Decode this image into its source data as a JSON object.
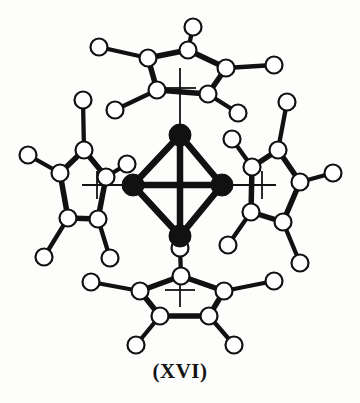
{
  "figure": {
    "label": "(XVI)",
    "diagram_type": "molecular-structure",
    "colors": {
      "background": "#fdfdfc",
      "bond_stroke": "#111111",
      "metal_fill": "#111111",
      "atom_fill": "#ffffff",
      "atom_stroke": "#111111",
      "axis_stroke": "#141414",
      "label_color": "#141414"
    },
    "geometry": {
      "metal_radius": 11,
      "carbon_radius": 8.5,
      "hydrogen_radius": 8.5,
      "bond_width": 5.5,
      "cluster_bond_width": 6.5,
      "axis_width": 1.8,
      "atom_stroke_width": 2.2
    },
    "metal_core": {
      "shape": "tetrahedron",
      "atoms": [
        {
          "id": "M1",
          "position": "top",
          "x": 180,
          "y": 135
        },
        {
          "id": "M2",
          "position": "left",
          "x": 133,
          "y": 185
        },
        {
          "id": "M3",
          "position": "right",
          "x": 222,
          "y": 185
        },
        {
          "id": "M4",
          "position": "bottom",
          "x": 180,
          "y": 236
        }
      ],
      "bonds": [
        {
          "from": "M1",
          "to": "M2"
        },
        {
          "from": "M1",
          "to": "M3"
        },
        {
          "from": "M2",
          "to": "M4"
        },
        {
          "from": "M3",
          "to": "M4"
        },
        {
          "from": "M2",
          "to": "M3"
        },
        {
          "from": "M1",
          "to": "M4"
        }
      ]
    },
    "axes": [
      {
        "id": "vertical-axis",
        "x1": 180,
        "y1": 68,
        "x2": 180,
        "y2": 307
      },
      {
        "id": "horizontal-axis",
        "x1": 82,
        "y1": 185,
        "x2": 276,
        "y2": 185
      },
      {
        "id": "tick-top-upper",
        "x1": 164,
        "y1": 88,
        "x2": 196,
        "y2": 88
      },
      {
        "id": "tick-bottom-lower",
        "x1": 165,
        "y1": 290,
        "x2": 195,
        "y2": 290
      },
      {
        "id": "tick-left-outer",
        "x1": 97,
        "y1": 171,
        "x2": 97,
        "y2": 199
      },
      {
        "id": "tick-right-outer",
        "x1": 262,
        "y1": 171,
        "x2": 262,
        "y2": 199
      }
    ],
    "ligands": [
      {
        "id": "cp-top",
        "name": "cyclopentadienyl-top",
        "formula": "C5H5",
        "bonded_metal": "M1",
        "carbons": [
          {
            "id": "C1",
            "x": 188,
            "y": 50
          },
          {
            "id": "C2",
            "x": 148,
            "y": 58
          },
          {
            "id": "C3",
            "x": 157,
            "y": 90
          },
          {
            "id": "C4",
            "x": 208,
            "y": 94
          },
          {
            "id": "C5",
            "x": 226,
            "y": 68
          }
        ],
        "hydrogens": [
          {
            "id": "H1",
            "x": 193,
            "y": 27,
            "carbon": "C1"
          },
          {
            "id": "H2",
            "x": 99,
            "y": 47,
            "carbon": "C2"
          },
          {
            "id": "H3",
            "x": 115,
            "y": 110,
            "carbon": "C3"
          },
          {
            "id": "H4",
            "x": 238,
            "y": 113,
            "carbon": "C4"
          },
          {
            "id": "H5",
            "x": 274,
            "y": 65,
            "carbon": "C5"
          }
        ]
      },
      {
        "id": "cp-left",
        "name": "cyclopentadienyl-left",
        "formula": "C5H5",
        "bonded_metal": "M2",
        "carbons": [
          {
            "id": "C1",
            "x": 84,
            "y": 150
          },
          {
            "id": "C2",
            "x": 60,
            "y": 173
          },
          {
            "id": "C3",
            "x": 68,
            "y": 218
          },
          {
            "id": "C4",
            "x": 98,
            "y": 219
          },
          {
            "id": "C5",
            "x": 106,
            "y": 177
          }
        ],
        "hydrogens": [
          {
            "id": "H1",
            "x": 83,
            "y": 100,
            "carbon": "C1"
          },
          {
            "id": "H2",
            "x": 28,
            "y": 155,
            "carbon": "C2"
          },
          {
            "id": "H3",
            "x": 44,
            "y": 257,
            "carbon": "C3"
          },
          {
            "id": "H4",
            "x": 110,
            "y": 258,
            "carbon": "C4"
          },
          {
            "id": "H5",
            "x": 127,
            "y": 164,
            "carbon": "C5"
          }
        ]
      },
      {
        "id": "cp-right",
        "name": "cyclopentadienyl-right",
        "formula": "C5H5",
        "bonded_metal": "M3",
        "carbons": [
          {
            "id": "C1",
            "x": 278,
            "y": 150
          },
          {
            "id": "C2",
            "x": 252,
            "y": 167
          },
          {
            "id": "C3",
            "x": 251,
            "y": 212
          },
          {
            "id": "C4",
            "x": 283,
            "y": 222
          },
          {
            "id": "C5",
            "x": 300,
            "y": 182
          }
        ],
        "hydrogens": [
          {
            "id": "H1",
            "x": 287,
            "y": 102,
            "carbon": "C1"
          },
          {
            "id": "H2",
            "x": 232,
            "y": 139,
            "carbon": "C2"
          },
          {
            "id": "H3",
            "x": 228,
            "y": 245,
            "carbon": "C3"
          },
          {
            "id": "H4",
            "x": 300,
            "y": 263,
            "carbon": "C4"
          },
          {
            "id": "H5",
            "x": 333,
            "y": 173,
            "carbon": "C5"
          }
        ]
      },
      {
        "id": "cp-bottom",
        "name": "cyclopentadienyl-bottom",
        "formula": "C5H5",
        "bonded_metal": "M4",
        "carbons": [
          {
            "id": "C1",
            "x": 181,
            "y": 276
          },
          {
            "id": "C2",
            "x": 140,
            "y": 291
          },
          {
            "id": "C3",
            "x": 160,
            "y": 316
          },
          {
            "id": "C4",
            "x": 209,
            "y": 316
          },
          {
            "id": "C5",
            "x": 224,
            "y": 291
          }
        ],
        "hydrogens": [
          {
            "id": "H1",
            "x": 180,
            "y": 248,
            "carbon": "C1"
          },
          {
            "id": "H2",
            "x": 91,
            "y": 282,
            "carbon": "C2"
          },
          {
            "id": "H3",
            "x": 136,
            "y": 345,
            "carbon": "C3"
          },
          {
            "id": "H4",
            "x": 234,
            "y": 345,
            "carbon": "C4"
          },
          {
            "id": "H5",
            "x": 274,
            "y": 281,
            "carbon": "C5"
          }
        ]
      }
    ]
  }
}
